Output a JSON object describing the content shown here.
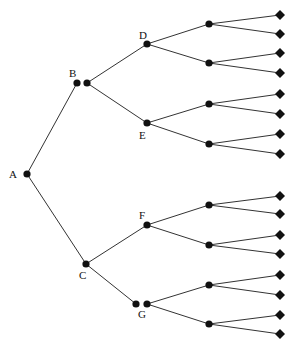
{
  "diagram": {
    "type": "game-tree",
    "colors": {
      "edge": "#333333",
      "node": "#111111",
      "background": "#ffffff"
    },
    "labels": {
      "A": "A",
      "B": "B",
      "C": "C",
      "D": "D",
      "E": "E",
      "F": "F",
      "G": "G"
    },
    "nodes": [
      {
        "id": "A",
        "x": 27,
        "y": 174,
        "shape": "circle",
        "label": "A",
        "lx": 9,
        "ly": 178
      },
      {
        "id": "B1",
        "x": 77,
        "y": 83,
        "shape": "circle",
        "label": "B",
        "lx": 69,
        "ly": 77
      },
      {
        "id": "B2",
        "x": 87,
        "y": 83,
        "shape": "circle"
      },
      {
        "id": "C",
        "x": 86,
        "y": 264,
        "shape": "circle",
        "label": "C",
        "lx": 79,
        "ly": 279
      },
      {
        "id": "D",
        "x": 147,
        "y": 44,
        "shape": "circle",
        "label": "D",
        "lx": 139,
        "ly": 39
      },
      {
        "id": "E",
        "x": 147,
        "y": 123,
        "shape": "circle",
        "label": "E",
        "lx": 139,
        "ly": 139
      },
      {
        "id": "F",
        "x": 147,
        "y": 225,
        "shape": "circle",
        "label": "F",
        "lx": 139,
        "ly": 219
      },
      {
        "id": "G1",
        "x": 136,
        "y": 304,
        "shape": "circle"
      },
      {
        "id": "G2",
        "x": 147,
        "y": 304,
        "shape": "circle",
        "label": "G",
        "lx": 138,
        "ly": 318
      },
      {
        "id": "D1",
        "x": 209,
        "y": 24,
        "shape": "circle"
      },
      {
        "id": "D2",
        "x": 209,
        "y": 63,
        "shape": "circle"
      },
      {
        "id": "E1",
        "x": 209,
        "y": 104,
        "shape": "circle"
      },
      {
        "id": "E2",
        "x": 209,
        "y": 144,
        "shape": "circle"
      },
      {
        "id": "F1",
        "x": 209,
        "y": 205,
        "shape": "circle"
      },
      {
        "id": "F2",
        "x": 209,
        "y": 245,
        "shape": "circle"
      },
      {
        "id": "G3",
        "x": 209,
        "y": 285,
        "shape": "circle"
      },
      {
        "id": "G4",
        "x": 209,
        "y": 324,
        "shape": "circle"
      },
      {
        "id": "L1",
        "x": 280,
        "y": 15,
        "shape": "diamond"
      },
      {
        "id": "L2",
        "x": 280,
        "y": 34,
        "shape": "diamond"
      },
      {
        "id": "L3",
        "x": 280,
        "y": 53,
        "shape": "diamond"
      },
      {
        "id": "L4",
        "x": 280,
        "y": 73,
        "shape": "diamond"
      },
      {
        "id": "L5",
        "x": 280,
        "y": 94,
        "shape": "diamond"
      },
      {
        "id": "L6",
        "x": 280,
        "y": 114,
        "shape": "diamond"
      },
      {
        "id": "L7",
        "x": 280,
        "y": 134,
        "shape": "diamond"
      },
      {
        "id": "L8",
        "x": 280,
        "y": 154,
        "shape": "diamond"
      },
      {
        "id": "L9",
        "x": 280,
        "y": 196,
        "shape": "diamond"
      },
      {
        "id": "L10",
        "x": 280,
        "y": 214,
        "shape": "diamond"
      },
      {
        "id": "L11",
        "x": 280,
        "y": 235,
        "shape": "diamond"
      },
      {
        "id": "L12",
        "x": 280,
        "y": 254,
        "shape": "diamond"
      },
      {
        "id": "L13",
        "x": 280,
        "y": 275,
        "shape": "diamond"
      },
      {
        "id": "L14",
        "x": 280,
        "y": 295,
        "shape": "diamond"
      },
      {
        "id": "L15",
        "x": 280,
        "y": 315,
        "shape": "diamond"
      },
      {
        "id": "L16",
        "x": 280,
        "y": 334,
        "shape": "diamond"
      }
    ],
    "edges": [
      [
        "A",
        "B1"
      ],
      [
        "A",
        "C"
      ],
      [
        "B2",
        "D"
      ],
      [
        "B2",
        "E"
      ],
      [
        "C",
        "F"
      ],
      [
        "C",
        "G1"
      ],
      [
        "D",
        "D1"
      ],
      [
        "D",
        "D2"
      ],
      [
        "E",
        "E1"
      ],
      [
        "E",
        "E2"
      ],
      [
        "F",
        "F1"
      ],
      [
        "F",
        "F2"
      ],
      [
        "G2",
        "G3"
      ],
      [
        "G2",
        "G4"
      ],
      [
        "D1",
        "L1"
      ],
      [
        "D1",
        "L2"
      ],
      [
        "D2",
        "L3"
      ],
      [
        "D2",
        "L4"
      ],
      [
        "E1",
        "L5"
      ],
      [
        "E1",
        "L6"
      ],
      [
        "E2",
        "L7"
      ],
      [
        "E2",
        "L8"
      ],
      [
        "F1",
        "L9"
      ],
      [
        "F1",
        "L10"
      ],
      [
        "F2",
        "L11"
      ],
      [
        "F2",
        "L12"
      ],
      [
        "G3",
        "L13"
      ],
      [
        "G3",
        "L14"
      ],
      [
        "G4",
        "L15"
      ],
      [
        "G4",
        "L16"
      ]
    ]
  }
}
